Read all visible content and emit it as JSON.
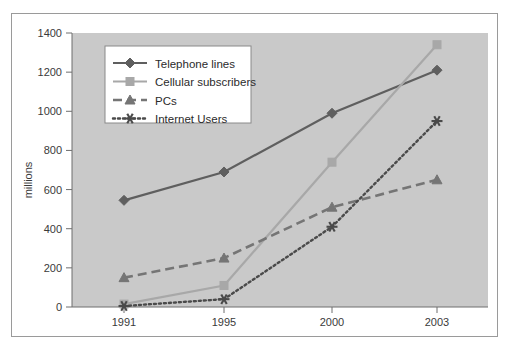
{
  "chart_data": {
    "type": "line",
    "title": "",
    "subtitle": "",
    "xlabel": "",
    "ylabel": "millions",
    "categories": [
      "1991",
      "1995",
      "2000",
      "2003"
    ],
    "x_tick_labels": [
      "1991",
      "1995",
      "2000",
      "2003"
    ],
    "y_tick_labels": [
      "0",
      "200",
      "400",
      "600",
      "800",
      "1000",
      "1200",
      "1400"
    ],
    "y_ticks": [
      0,
      200,
      400,
      600,
      800,
      1000,
      1200,
      1400
    ],
    "ylim": [
      0,
      1400
    ],
    "grid": false,
    "legend_position": "upper-left-inside",
    "plot_background": "#c9c9c9",
    "series": [
      {
        "name": "Telephone lines",
        "values": [
          545,
          690,
          990,
          1210
        ],
        "color": "#5f5f5f",
        "marker": "diamond",
        "dash": "solid"
      },
      {
        "name": "Cellular subscribers",
        "values": [
          15,
          110,
          740,
          1340
        ],
        "color": "#a8a8a8",
        "marker": "square",
        "dash": "solid"
      },
      {
        "name": "PCs",
        "values": [
          150,
          250,
          510,
          650
        ],
        "color": "#757575",
        "marker": "triangle",
        "dash": "dashed"
      },
      {
        "name": "Internet Users",
        "values": [
          5,
          40,
          410,
          950
        ],
        "color": "#4a4a4a",
        "marker": "star",
        "dash": "dotted"
      }
    ]
  },
  "legend": {
    "items": [
      {
        "label": "Telephone lines"
      },
      {
        "label": "Cellular subscribers"
      },
      {
        "label": "PCs"
      },
      {
        "label": "Internet Users"
      }
    ]
  },
  "axes": {
    "y_axis_title": "millions"
  }
}
